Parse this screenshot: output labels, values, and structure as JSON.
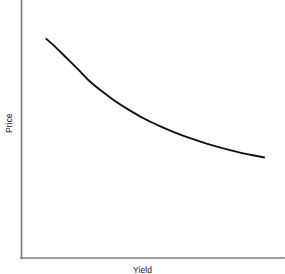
{
  "chart_data": {
    "type": "line",
    "title": "",
    "xlabel": "Yield",
    "ylabel": "Price",
    "grid": false,
    "legend": null,
    "axis_ticks": {
      "x": [],
      "y": []
    },
    "xlim": [
      0,
      100
    ],
    "ylim": [
      0,
      100
    ],
    "series": [
      {
        "name": "Price-Yield Curve",
        "color": "#111111",
        "x": [
          5.3,
          8.5,
          13.5,
          19.0,
          23.4,
          29.0,
          34.9,
          41.1,
          47.4,
          54.0,
          60.8,
          67.6,
          74.4,
          81.2,
          88.0,
          94.3,
          99.2
        ],
        "y": [
          91.1,
          87.2,
          80.4,
          72.8,
          66.5,
          60.0,
          53.9,
          48.4,
          43.4,
          39.0,
          35.0,
          31.5,
          28.4,
          25.7,
          23.3,
          21.4,
          20.1
        ]
      }
    ]
  },
  "figure": {
    "axis_color": "#7a7a7a",
    "curve_color": "#111111",
    "background": "#ffffff",
    "y_axis_label": "Price",
    "x_axis_label": "Yield"
  }
}
